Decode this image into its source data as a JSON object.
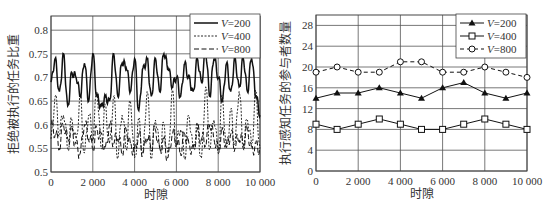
{
  "chart_data": [
    {
      "type": "line",
      "title": "",
      "xlabel": "时隙",
      "ylabel": "拒绝被执行的任务比重",
      "xlim": [
        0,
        10000
      ],
      "ylim": [
        0.5,
        0.83
      ],
      "xticks": [
        "0",
        "2 000",
        "4 000",
        "6 000",
        "8 000",
        "10 000"
      ],
      "yticks": [
        "0.5",
        "0.55",
        "0.6",
        "0.65",
        "0.7",
        "0.75",
        "0.8"
      ],
      "grid": true,
      "legend_position": "upper right",
      "x": [
        0,
        200,
        400,
        600,
        800,
        1000,
        1200,
        1400,
        1600,
        1800,
        2000,
        2200,
        2400,
        2600,
        2800,
        3000,
        3200,
        3400,
        3600,
        3800,
        4000,
        4200,
        4400,
        4600,
        4800,
        5000,
        5200,
        5400,
        5600,
        5800,
        6000,
        6200,
        6400,
        6600,
        6800,
        7000,
        7200,
        7400,
        7600,
        7800,
        8000,
        8200,
        8400,
        8600,
        8800,
        9000,
        9200,
        9400,
        9600,
        9800,
        10000
      ],
      "series": [
        {
          "name": "V=200",
          "style": "solid",
          "values": [
            0.69,
            0.74,
            0.67,
            0.75,
            0.64,
            0.71,
            0.7,
            0.66,
            0.73,
            0.65,
            0.75,
            0.66,
            0.64,
            0.66,
            0.65,
            0.75,
            0.66,
            0.73,
            0.72,
            0.67,
            0.74,
            0.63,
            0.72,
            0.74,
            0.66,
            0.74,
            0.67,
            0.75,
            0.72,
            0.68,
            0.7,
            0.66,
            0.73,
            0.7,
            0.67,
            0.74,
            0.69,
            0.75,
            0.66,
            0.74,
            0.7,
            0.65,
            0.73,
            0.67,
            0.74,
            0.68,
            0.74,
            0.67,
            0.74,
            0.66,
            0.62
          ]
        },
        {
          "name": "V=400",
          "style": "dotted",
          "values": [
            0.57,
            0.66,
            0.58,
            0.62,
            0.55,
            0.61,
            0.57,
            0.66,
            0.54,
            0.62,
            0.57,
            0.67,
            0.55,
            0.64,
            0.56,
            0.66,
            0.53,
            0.62,
            0.55,
            0.65,
            0.53,
            0.61,
            0.54,
            0.67,
            0.53,
            0.61,
            0.55,
            0.6,
            0.54,
            0.67,
            0.56,
            0.59,
            0.53,
            0.62,
            0.55,
            0.6,
            0.53,
            0.68,
            0.55,
            0.61,
            0.54,
            0.66,
            0.55,
            0.63,
            0.56,
            0.67,
            0.55,
            0.61,
            0.56,
            0.67,
            0.55
          ]
        },
        {
          "name": "V=800",
          "style": "dashed",
          "values": [
            0.6,
            0.58,
            0.55,
            0.6,
            0.57,
            0.59,
            0.56,
            0.54,
            0.6,
            0.57,
            0.55,
            0.59,
            0.58,
            0.55,
            0.6,
            0.56,
            0.57,
            0.54,
            0.59,
            0.56,
            0.55,
            0.58,
            0.54,
            0.57,
            0.55,
            0.59,
            0.55,
            0.57,
            0.53,
            0.58,
            0.56,
            0.54,
            0.58,
            0.56,
            0.55,
            0.59,
            0.57,
            0.56,
            0.6,
            0.57,
            0.55,
            0.59,
            0.56,
            0.58,
            0.55,
            0.57,
            0.56,
            0.59,
            0.55,
            0.56,
            0.55
          ]
        }
      ]
    },
    {
      "type": "line",
      "title": "",
      "xlabel": "时隙",
      "ylabel": "执行感知任务的参与者数量",
      "xlim": [
        0,
        10000
      ],
      "ylim": [
        0,
        30
      ],
      "xticks": [
        "0",
        "2 000",
        "4 000",
        "6 000",
        "8 000",
        "10 000"
      ],
      "yticks": [
        "0",
        "4",
        "8",
        "12",
        "16",
        "20",
        "24",
        "28"
      ],
      "grid": true,
      "legend_position": "upper right",
      "x": [
        0,
        1000,
        2000,
        3000,
        4000,
        5000,
        6000,
        7000,
        8000,
        9000,
        10000
      ],
      "series": [
        {
          "name": "V=200",
          "marker": "filled-triangle",
          "style": "solid",
          "values": [
            14,
            15,
            15,
            16,
            15,
            14,
            16,
            17,
            15,
            14,
            15
          ]
        },
        {
          "name": "V=400",
          "marker": "open-square",
          "style": "solid",
          "values": [
            9,
            8,
            9,
            10,
            9,
            8,
            8,
            9,
            10,
            9,
            8
          ]
        },
        {
          "name": "V=800",
          "marker": "open-circle",
          "style": "dashed",
          "values": [
            19,
            20,
            19,
            19,
            21,
            21,
            19,
            19,
            20,
            19,
            18
          ]
        }
      ]
    }
  ],
  "legend_prefix": "V",
  "legend_values": [
    "=200",
    "=400",
    "=800"
  ]
}
